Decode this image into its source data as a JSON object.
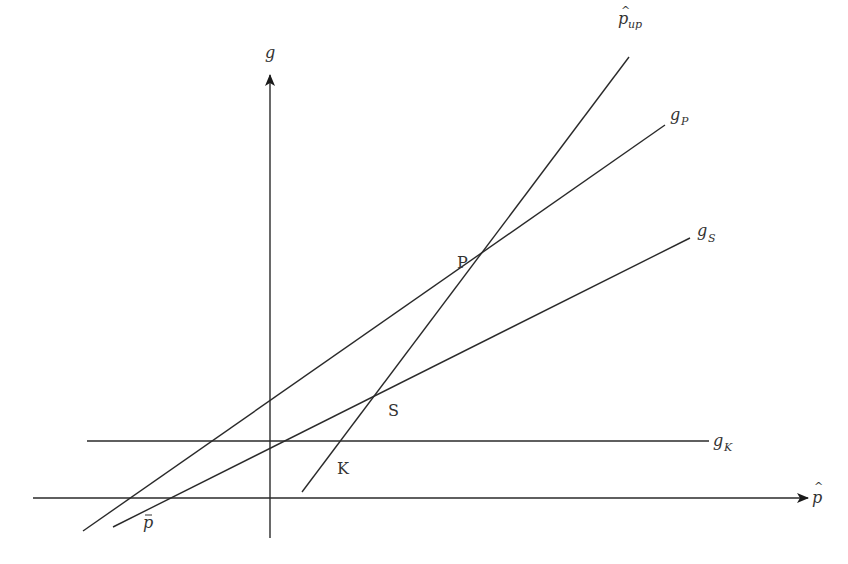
{
  "diagram": {
    "axes": {
      "x": {
        "label": "p̂",
        "label_main": "p",
        "from": [
          33,
          498
        ],
        "to": [
          808,
          498
        ]
      },
      "y": {
        "label": "g",
        "from": [
          270,
          538
        ],
        "to": [
          270,
          75
        ]
      }
    },
    "lines": [
      {
        "id": "g_K",
        "label_main": "g",
        "label_sub": "K",
        "from": [
          87,
          441
        ],
        "to": [
          709,
          441
        ],
        "label_pos": [
          713,
          446
        ]
      },
      {
        "id": "g_S",
        "label_main": "g",
        "label_sub": "S",
        "from": [
          113,
          527
        ],
        "to": [
          690,
          238
        ],
        "label_pos": [
          697,
          236
        ]
      },
      {
        "id": "g_P",
        "label_main": "g",
        "label_sub": "P",
        "from": [
          83,
          531
        ],
        "to": [
          665,
          125
        ],
        "label_pos": [
          670,
          120
        ]
      },
      {
        "id": "p_up",
        "label_main": "p",
        "label_sub": "up",
        "from": [
          302,
          492
        ],
        "to": [
          629,
          57
        ],
        "label_pos": [
          620,
          24
        ]
      }
    ],
    "points": [
      {
        "id": "P",
        "label": "P",
        "pos": [
          472,
          262
        ],
        "label_pos": [
          457,
          268
        ]
      },
      {
        "id": "S",
        "label": "S",
        "pos": [
          381,
          386
        ],
        "label_pos": [
          388,
          416
        ]
      },
      {
        "id": "K",
        "label": "K",
        "pos": [
          343,
          441
        ],
        "label_pos": [
          337,
          474
        ]
      },
      {
        "id": "p_bar",
        "label": "p̄",
        "label_main": "p",
        "pos": [
          150,
          498
        ],
        "label_pos": [
          143,
          528
        ]
      }
    ]
  }
}
